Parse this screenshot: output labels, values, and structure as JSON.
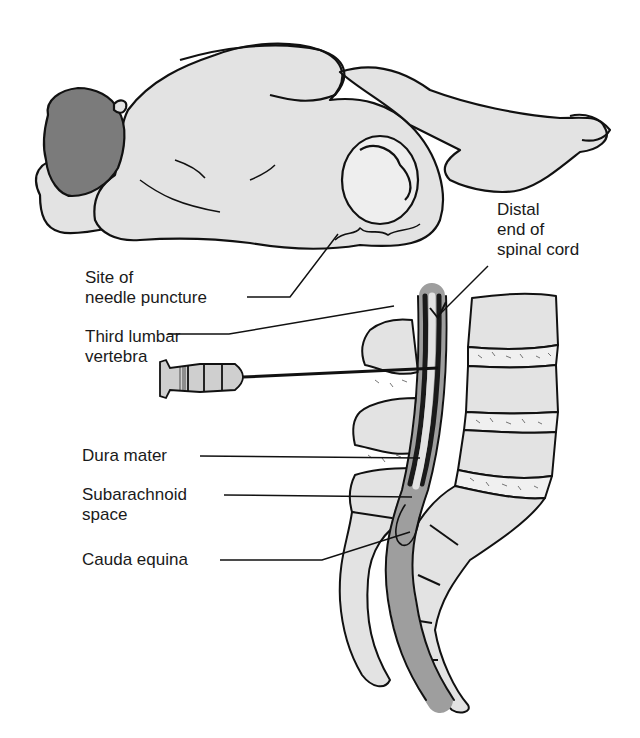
{
  "figure": {
    "colors": {
      "tissue_fill": "#e3e3e3",
      "hair_fill": "#7b7b7b",
      "outline": "#111111",
      "dura": "#1a1a1a",
      "subarachnoid": "#9e9e9e",
      "background": "#ffffff"
    }
  },
  "labels": {
    "distal_end": "Distal\nend of\nspinal cord",
    "needle_site": "Site of\nneedle puncture",
    "third_lumbar": "Third lumbar\nvertebra",
    "dura_mater": "Dura mater",
    "subarachnoid": "Subarachnoid\nspace",
    "cauda_equina": "Cauda equina"
  }
}
